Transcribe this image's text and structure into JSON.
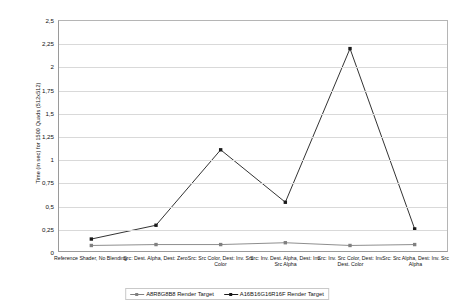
{
  "chart_data": {
    "type": "line",
    "title": "",
    "xlabel": "",
    "ylabel": "Time (in sec) for 1500 Quads (512x512)",
    "ylim": [
      0,
      2.5
    ],
    "ytick_step": 0.25,
    "grid": true,
    "decimal_separator": ",",
    "legend_position": "bottom",
    "ytick_labels": [
      "0",
      "0,25",
      "0,5",
      "0,75",
      "1",
      "1,25",
      "1,5",
      "1,75",
      "2",
      "2,25",
      "2,5"
    ],
    "ytick_values": [
      0,
      0.25,
      0.5,
      0.75,
      1,
      1.25,
      1.5,
      1.75,
      2,
      2.25,
      2.5
    ],
    "categories": [
      "Reference Shader, No Blending",
      "Src: Dest. Alpha, Dest: Zero",
      "Src: Src Color, Dest: Inv. Src Color",
      "Src: Inv. Dest. Alpha, Dest: Inv. Src Alpha",
      "Src: Inv. Src Color, Dest: Inv. Dest. Color",
      "Src: Src Alpha, Dest: Inv. Src Alpha"
    ],
    "series": [
      {
        "name": "A8R8G8B8 Render Target",
        "color": "#808080",
        "values": [
          0.06,
          0.07,
          0.07,
          0.09,
          0.06,
          0.07
        ]
      },
      {
        "name": "A16B16G16R16F Render Target",
        "color": "#1a1a1a",
        "values": [
          0.13,
          0.28,
          1.1,
          0.53,
          2.2,
          0.24
        ]
      }
    ]
  },
  "legend": {
    "entries": [
      {
        "label": "A8R8G8B8 Render Target"
      },
      {
        "label": "A16B16G16R16F Render Target"
      }
    ]
  }
}
